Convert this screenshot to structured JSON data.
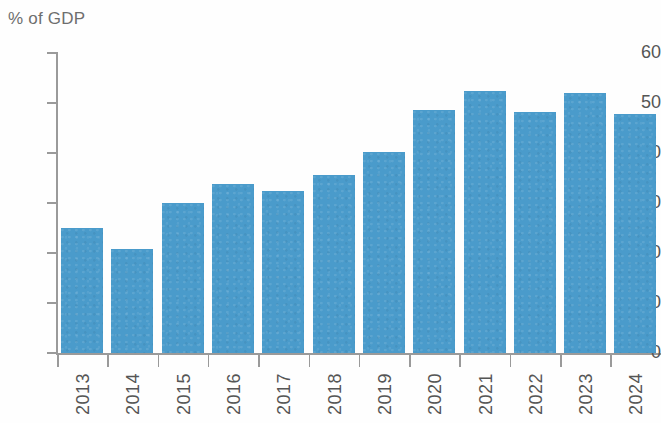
{
  "chart_data": {
    "type": "bar",
    "title": "",
    "subtitle": "",
    "xlabel": "",
    "ylabel": "% of GDP",
    "categories": [
      "2013",
      "2014",
      "2015",
      "2016",
      "2017",
      "2018",
      "2019",
      "2020",
      "2021",
      "2022",
      "2023",
      "2024"
    ],
    "values": [
      25.0,
      20.8,
      30.0,
      33.8,
      32.5,
      35.6,
      40.2,
      48.6,
      52.5,
      48.2,
      52.0,
      47.8
    ],
    "ylim": [
      0,
      60
    ],
    "yticks": [
      "0",
      "10",
      "20",
      "30",
      "40",
      "50",
      "60"
    ],
    "ytick_values": [
      0,
      10,
      20,
      30,
      40,
      50,
      60
    ],
    "grid": false,
    "legend": false,
    "legend_position": "none",
    "series": [
      {
        "name": "% of GDP",
        "color": "#4a9bcb",
        "values": [
          25.0,
          20.8,
          30.0,
          33.8,
          32.5,
          35.6,
          40.2,
          48.6,
          52.5,
          48.2,
          52.0,
          47.8
        ]
      }
    ],
    "annotations": []
  },
  "colors": {
    "bar": "#4a9bcb",
    "axis": "#9a9a9a",
    "tick_text": "#555555",
    "title_text": "#6e6e6e",
    "background": "#fefefe"
  },
  "axis": {
    "y_title": "% of GDP"
  }
}
